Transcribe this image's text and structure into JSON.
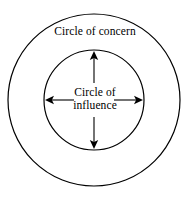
{
  "diagram": {
    "type": "concentric-circles",
    "background_color": "#ffffff",
    "stroke_color": "#000000",
    "outer_circle": {
      "label": "Circle of concern",
      "center_x": 94,
      "center_y": 100,
      "radius": 86,
      "stroke_width": 1.2
    },
    "inner_circle": {
      "label_line1": "Circle of",
      "label_line2": "influence",
      "center_x": 94,
      "center_y": 100,
      "radius": 50,
      "stroke_width": 1.2
    },
    "arrows": [
      {
        "name": "arrow-up",
        "direction": "up",
        "from_x": 94,
        "from_y": 83,
        "to_x": 94,
        "to_y": 51
      },
      {
        "name": "arrow-down",
        "direction": "down",
        "from_x": 94,
        "from_y": 117,
        "to_x": 94,
        "to_y": 149
      },
      {
        "name": "arrow-left",
        "direction": "left",
        "from_x": 74,
        "from_y": 100,
        "to_x": 45,
        "to_y": 100
      },
      {
        "name": "arrow-right",
        "direction": "right",
        "from_x": 114,
        "from_y": 100,
        "to_x": 143,
        "to_y": 100
      }
    ]
  }
}
